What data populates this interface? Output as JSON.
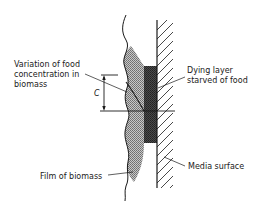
{
  "diagram": {
    "type": "cross-section",
    "labels": {
      "food_variation_line1": "Variation of food",
      "food_variation_line2": "concentration in",
      "food_variation_line3": "biomass",
      "dimension_symbol": "C",
      "dying_layer_line1": "Dying layer",
      "dying_layer_line2": "starved of food",
      "media_surface": "Media surface",
      "film_of_biomass": "Film of biomass"
    },
    "colors": {
      "line": "#1a1a1a",
      "biomass_fill": "#9a9a9a",
      "dying_layer_fill": "#3a3a3a",
      "background": "#ffffff"
    }
  }
}
